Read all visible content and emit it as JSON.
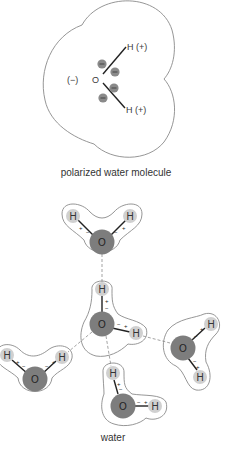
{
  "figure": {
    "top_panel": {
      "caption": "polarized water molecule",
      "oxygen_label": "O",
      "oxygen_charge": "(−)",
      "hydrogen_top_label": "H (+)",
      "hydrogen_bottom_label": "H (+)",
      "electron_symbol": "−",
      "electron_count": 4
    },
    "bottom_panel": {
      "caption": "water",
      "molecules": [
        {
          "id": "top",
          "oxygen": "O",
          "hydrogens": [
            "H",
            "H"
          ],
          "charges": [
            "+",
            "−",
            "−",
            "+"
          ]
        },
        {
          "id": "center",
          "oxygen": "O",
          "hydrogens": [
            "H",
            "H"
          ],
          "charges": [
            "+",
            "−",
            "−",
            "+"
          ]
        },
        {
          "id": "right",
          "oxygen": "O",
          "hydrogens": [
            "H",
            "H"
          ],
          "charges": [
            "+",
            "−",
            "−",
            "+"
          ]
        },
        {
          "id": "left",
          "oxygen": "O",
          "hydrogens": [
            "H",
            "H"
          ],
          "charges": [
            "+",
            "−",
            "−",
            "+"
          ]
        },
        {
          "id": "bottom",
          "oxygen": "O",
          "hydrogens": [
            "H",
            "H"
          ],
          "charges": [
            "+",
            "−",
            "−",
            "+"
          ]
        }
      ],
      "hydrogen_bond_style": "dashed"
    },
    "colors": {
      "oxygen_fill": "#7d7d7d",
      "hydrogen_fill": "#d0d0d0",
      "outline": "#8a8a8a",
      "text": "#333333"
    }
  }
}
